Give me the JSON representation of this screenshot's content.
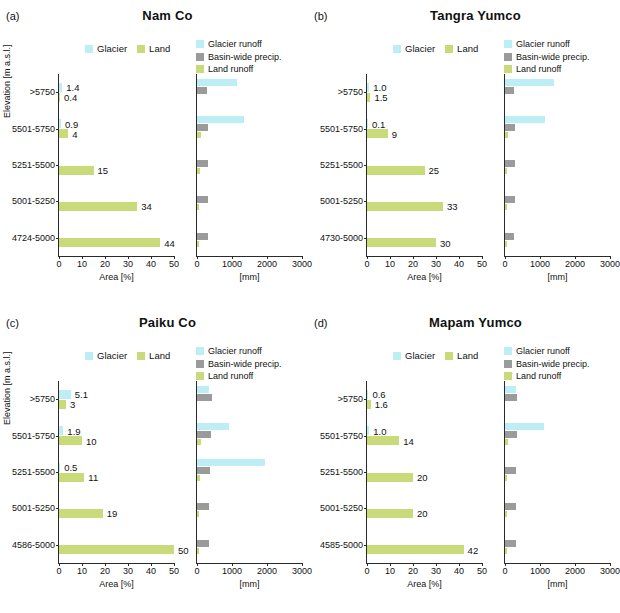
{
  "figure": {
    "axis_label_y": "Elevation [m a.s.l.]",
    "axis_label_x_left": "Area [%]",
    "axis_label_x_right": "[mm]",
    "legend_left": [
      "Glacier",
      "Land"
    ],
    "legend_right": [
      "Glacier runoff",
      "Basin-wide precip.",
      "Land runoff"
    ],
    "colors": {
      "glacier": "#bdeef5",
      "land": "#c9da7a",
      "precip": "#9b9b9b"
    },
    "xticks_left": [
      "0",
      "10",
      "20",
      "30",
      "40",
      "50"
    ],
    "xticks_right": [
      "0",
      "1000",
      "2000",
      "3000"
    ]
  },
  "chart_data": [
    {
      "type": "bar",
      "panel": "a",
      "title": "Nam Co",
      "xlabel": "Area [%]",
      "ylabel": "Elevation [m a.s.l.]",
      "categories": [
        "4724-5000",
        "5001-5250",
        "5251-5500",
        "5501-5750",
        ">5750"
      ],
      "xlim_left": [
        0,
        50
      ],
      "xlim_right": [
        0,
        3000
      ],
      "series": [
        {
          "name": "Glacier",
          "values": [
            0.0,
            0.0,
            0.0,
            0.9,
            1.4
          ],
          "labels": [
            "",
            "",
            "",
            "0.9",
            "1.4"
          ]
        },
        {
          "name": "Land",
          "values": [
            44,
            34,
            15,
            4,
            0.4
          ],
          "labels": [
            "44",
            "34",
            "15",
            "4",
            "0.4"
          ]
        },
        {
          "name": "Glacier runoff",
          "values": [
            0,
            0,
            0,
            1350,
            1150
          ]
        },
        {
          "name": "Basin-wide precip.",
          "values": [
            300,
            300,
            300,
            300,
            290
          ]
        },
        {
          "name": "Land runoff",
          "values": [
            60,
            70,
            80,
            110,
            0
          ]
        }
      ]
    },
    {
      "type": "bar",
      "panel": "b",
      "title": "Tangra Yumco",
      "xlabel": "Area [%]",
      "ylabel": "",
      "categories": [
        "4730-5000",
        "5001-5250",
        "5251-5500",
        "5501-5750",
        ">5750"
      ],
      "xlim_left": [
        0,
        50
      ],
      "xlim_right": [
        0,
        3000
      ],
      "series": [
        {
          "name": "Glacier",
          "values": [
            0.0,
            0.0,
            0.0,
            0.1,
            1.0
          ],
          "labels": [
            "",
            "",
            "",
            "0.1",
            "1.0"
          ]
        },
        {
          "name": "Land",
          "values": [
            30,
            33,
            25,
            9,
            1.5
          ],
          "labels": [
            "30",
            "33",
            "25",
            "9",
            "1.5"
          ]
        },
        {
          "name": "Glacier runoff",
          "values": [
            0,
            0,
            0,
            1150,
            1400
          ]
        },
        {
          "name": "Basin-wide precip.",
          "values": [
            270,
            280,
            280,
            280,
            270
          ]
        },
        {
          "name": "Land runoff",
          "values": [
            40,
            50,
            60,
            80,
            0
          ]
        }
      ]
    },
    {
      "type": "bar",
      "panel": "c",
      "title": "Paiku Co",
      "xlabel": "Area [%]",
      "ylabel": "Elevation [m a.s.l.]",
      "categories": [
        "4586-5000",
        "5001-5250",
        "5251-5500",
        "5501-5750",
        ">5750"
      ],
      "xlim_left": [
        0,
        50
      ],
      "xlim_right": [
        0,
        3000
      ],
      "series": [
        {
          "name": "Glacier",
          "values": [
            0.0,
            0.0,
            0.5,
            1.9,
            5.1
          ],
          "labels": [
            "",
            "",
            "0.5",
            "1.9",
            "5.1"
          ]
        },
        {
          "name": "Land",
          "values": [
            50,
            19,
            11,
            10,
            3
          ],
          "labels": [
            "50",
            "19",
            "11",
            "10",
            "3"
          ]
        },
        {
          "name": "Glacier runoff",
          "values": [
            0,
            0,
            1950,
            900,
            350
          ]
        },
        {
          "name": "Basin-wide precip.",
          "values": [
            330,
            350,
            360,
            390,
            420
          ]
        },
        {
          "name": "Land runoff",
          "values": [
            40,
            60,
            80,
            100,
            0
          ]
        }
      ]
    },
    {
      "type": "bar",
      "panel": "d",
      "title": "Mapam Yumco",
      "xlabel": "Area [%]",
      "ylabel": "",
      "categories": [
        "4585-5000",
        "5001-5250",
        "5251-5500",
        "5501-5750",
        ">5750"
      ],
      "xlim_left": [
        0,
        50
      ],
      "xlim_right": [
        0,
        3000
      ],
      "series": [
        {
          "name": "Glacier",
          "values": [
            0.0,
            0.0,
            0.0,
            1.0,
            0.6
          ],
          "labels": [
            "",
            "",
            "",
            "1.0",
            "0.6"
          ]
        },
        {
          "name": "Land",
          "values": [
            42,
            20,
            20,
            14,
            1.6
          ],
          "labels": [
            "42",
            "20",
            "20",
            "14",
            "1.6"
          ]
        },
        {
          "name": "Glacier runoff",
          "values": [
            0,
            0,
            0,
            1100,
            300
          ]
        },
        {
          "name": "Basin-wide precip.",
          "values": [
            300,
            310,
            320,
            330,
            330
          ]
        },
        {
          "name": "Land runoff",
          "values": [
            40,
            60,
            70,
            90,
            0
          ]
        }
      ]
    }
  ],
  "panel_letters": {
    "a": "(a)",
    "b": "(b)",
    "c": "(c)",
    "d": "(d)"
  }
}
